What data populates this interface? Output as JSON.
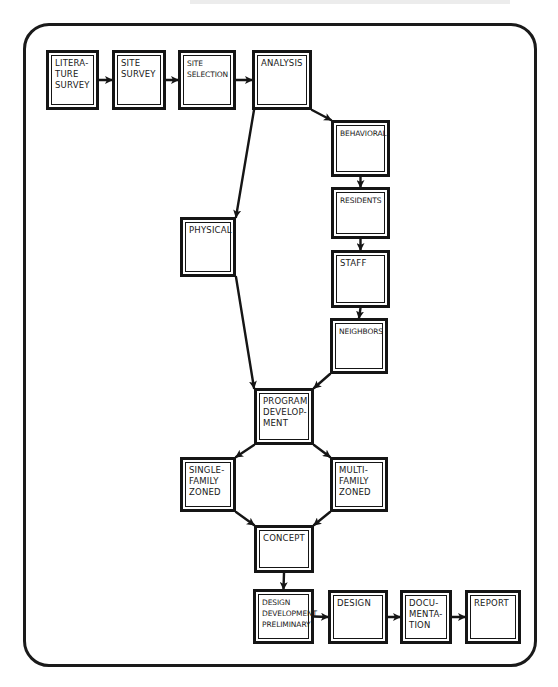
{
  "diagram": {
    "type": "flowchart",
    "style": "hand-drawn",
    "line_color": "#151515",
    "background": "#ffffff",
    "nodes": [
      {
        "id": "literature-survey",
        "label": "Litera-\nture\nSurvey"
      },
      {
        "id": "site-survey",
        "label": "Site\nSurvey"
      },
      {
        "id": "site-selection",
        "label": "Site\nSelection"
      },
      {
        "id": "analysis",
        "label": "Analysis"
      },
      {
        "id": "behavioral",
        "label": "Behavioral"
      },
      {
        "id": "residents",
        "label": "Residents"
      },
      {
        "id": "staff",
        "label": "Staff"
      },
      {
        "id": "neighbors",
        "label": "Neighbors"
      },
      {
        "id": "physical",
        "label": "Physical"
      },
      {
        "id": "program-development",
        "label": "Program\nDevelop-\nment"
      },
      {
        "id": "single-family-zoned",
        "label": "Single-\nFamily\nZoned"
      },
      {
        "id": "multi-family-zoned",
        "label": "Multi-\nFamily\nZoned"
      },
      {
        "id": "concept",
        "label": "Concept"
      },
      {
        "id": "design-development-preliminary",
        "label": "Design\nDevelopment\nPreliminary"
      },
      {
        "id": "design",
        "label": "Design"
      },
      {
        "id": "documentation",
        "label": "Docu-\nmenta-\ntion"
      },
      {
        "id": "report",
        "label": "Report"
      }
    ],
    "edges": [
      {
        "from": "literature-survey",
        "to": "site-survey"
      },
      {
        "from": "site-survey",
        "to": "site-selection"
      },
      {
        "from": "site-selection",
        "to": "analysis"
      },
      {
        "from": "analysis",
        "to": "behavioral"
      },
      {
        "from": "analysis",
        "to": "physical"
      },
      {
        "from": "behavioral",
        "to": "residents"
      },
      {
        "from": "residents",
        "to": "staff"
      },
      {
        "from": "staff",
        "to": "neighbors"
      },
      {
        "from": "physical",
        "to": "program-development"
      },
      {
        "from": "neighbors",
        "to": "program-development"
      },
      {
        "from": "program-development",
        "to": "single-family-zoned"
      },
      {
        "from": "program-development",
        "to": "multi-family-zoned"
      },
      {
        "from": "single-family-zoned",
        "to": "concept"
      },
      {
        "from": "multi-family-zoned",
        "to": "concept"
      },
      {
        "from": "concept",
        "to": "design-development-preliminary"
      },
      {
        "from": "design-development-preliminary",
        "to": "design"
      },
      {
        "from": "design",
        "to": "documentation"
      },
      {
        "from": "documentation",
        "to": "report"
      }
    ]
  }
}
